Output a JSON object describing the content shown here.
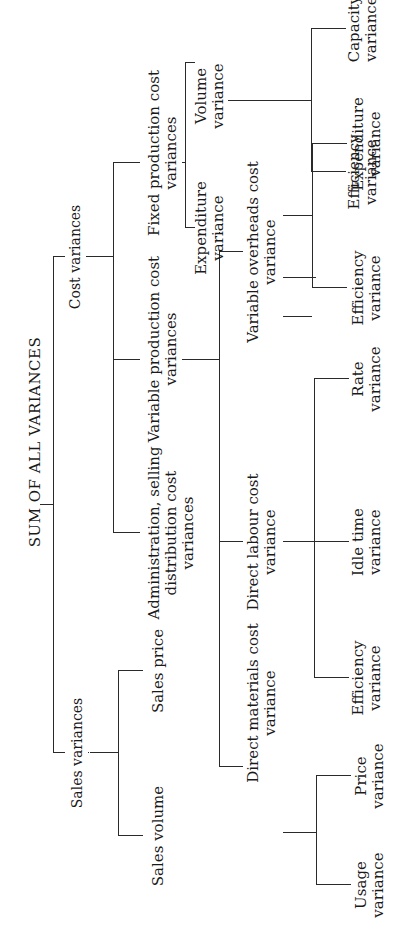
{
  "diagram": {
    "type": "tree",
    "orientation": "rotated-90-ccw",
    "root": {
      "label": "SUM OF ALL VARIANCES",
      "children": [
        {
          "label": "Cost variances",
          "children": [
            {
              "label": [
                "Fixed production cost",
                "variances"
              ],
              "children": [
                {
                  "label": [
                    "Expenditure",
                    "variance"
                  ]
                },
                {
                  "label": [
                    "Volume",
                    "variance"
                  ],
                  "children": [
                    {
                      "label": [
                        "Efficiency",
                        "variance"
                      ]
                    },
                    {
                      "label": [
                        "Capacity",
                        "variance"
                      ]
                    }
                  ]
                }
              ]
            },
            {
              "label": [
                "Variable production cost",
                "variances"
              ],
              "children": [
                {
                  "label": [
                    "Direct materials cost",
                    "variance"
                  ],
                  "children": [
                    {
                      "label": [
                        "Usage",
                        "variance"
                      ]
                    },
                    {
                      "label": [
                        "Price",
                        "variance"
                      ]
                    }
                  ]
                },
                {
                  "label": [
                    "Direct labour cost",
                    "variance"
                  ],
                  "children": [
                    {
                      "label": [
                        "Efficiency",
                        "variance"
                      ]
                    },
                    {
                      "label": [
                        "Idle time",
                        "variance"
                      ]
                    },
                    {
                      "label": [
                        "Rate",
                        "variance"
                      ]
                    }
                  ]
                },
                {
                  "label": [
                    "Variable overheads cost",
                    "variance"
                  ],
                  "children": [
                    {
                      "label": [
                        "Efficiency",
                        "variance"
                      ]
                    },
                    {
                      "label": [
                        "Expenditure",
                        "variance"
                      ]
                    }
                  ]
                }
              ]
            },
            {
              "label": [
                "Administration, selling",
                "distribution cost",
                "variances"
              ]
            }
          ]
        },
        {
          "label": "Sales variances",
          "children": [
            {
              "label": "Sales volume"
            },
            {
              "label": "Sales price"
            }
          ]
        }
      ]
    }
  },
  "labels": {
    "root": "SUM OF ALL VARIANCES",
    "cost": "Cost variances",
    "sales": "Sales variances",
    "sales_volume": "Sales volume",
    "sales_price": "Sales price",
    "fixed_1": "Fixed production cost",
    "fixed_2": "variances",
    "variable_1": "Variable production cost",
    "variable_2": "variances",
    "admin_1": "Administration, selling",
    "admin_2": "distribution cost",
    "admin_3": "variances",
    "fixed_exp_1": "Expenditure",
    "fixed_exp_2": "variance",
    "volume_1": "Volume",
    "volume_2": "variance",
    "vol_eff_1": "Efficiency",
    "vol_eff_2": "variance",
    "capacity_1": "Capacity",
    "capacity_2": "variance",
    "dm_1": "Direct materials cost",
    "dm_2": "variance",
    "dl_1": "Direct labour cost",
    "dl_2": "variance",
    "vo_1": "Variable overheads cost",
    "vo_2": "variance",
    "usage_1": "Usage",
    "usage_2": "variance",
    "price_1": "Price",
    "price_2": "variance",
    "dl_eff_1": "Efficiency",
    "dl_eff_2": "variance",
    "idle_1": "Idle time",
    "idle_2": "variance",
    "rate_1": "Rate",
    "rate_2": "variance",
    "vo_eff_1": "Efficiency",
    "vo_eff_2": "variance",
    "vo_exp_1": "Expenditure",
    "vo_exp_2": "variance"
  }
}
